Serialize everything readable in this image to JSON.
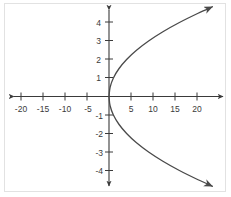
{
  "figure": {
    "title": "",
    "background_color": "#ffffff",
    "border_color": "#e2e2e2",
    "axis_color": "#3a3a3a",
    "curve_color": "#4a4a4a"
  },
  "chart_data": {
    "type": "line",
    "title": "",
    "xlabel": "",
    "ylabel": "",
    "xlim": [
      -25,
      25
    ],
    "ylim": [
      -5,
      5
    ],
    "grid": false,
    "legend": null,
    "x_ticks": [
      -20,
      -15,
      -10,
      -5,
      5,
      10,
      15,
      20
    ],
    "x_tick_labels": [
      "-20",
      "-15",
      "-10",
      "-5",
      "5",
      "10",
      "15",
      "20"
    ],
    "y_ticks": [
      4,
      3,
      2,
      1,
      -1,
      -2,
      -3,
      -4
    ],
    "y_tick_labels": [
      "4",
      "3",
      "2",
      "1",
      "-1",
      "-2",
      "-3",
      "-4"
    ],
    "x_tick_step": 5,
    "y_tick_step": 1,
    "series": [
      {
        "name": "upper-branch",
        "equation": "y = sqrt(x)",
        "points": [
          {
            "x": 0,
            "y": 0
          },
          {
            "x": 0.25,
            "y": 0.5
          },
          {
            "x": 1,
            "y": 1
          },
          {
            "x": 2.25,
            "y": 1.5
          },
          {
            "x": 4,
            "y": 2
          },
          {
            "x": 6.25,
            "y": 2.5
          },
          {
            "x": 9,
            "y": 3
          },
          {
            "x": 12.25,
            "y": 3.5
          },
          {
            "x": 16,
            "y": 4
          },
          {
            "x": 20.25,
            "y": 4.5
          },
          {
            "x": 23.5,
            "y": 4.85
          }
        ],
        "arrow_end": true
      },
      {
        "name": "lower-branch",
        "equation": "y = -sqrt(x)",
        "points": [
          {
            "x": 0,
            "y": 0
          },
          {
            "x": 0.25,
            "y": -0.5
          },
          {
            "x": 1,
            "y": -1
          },
          {
            "x": 2.25,
            "y": -1.5
          },
          {
            "x": 4,
            "y": -2
          },
          {
            "x": 6.25,
            "y": -2.5
          },
          {
            "x": 9,
            "y": -3
          },
          {
            "x": 12.25,
            "y": -3.5
          },
          {
            "x": 16,
            "y": -4
          },
          {
            "x": 20.25,
            "y": -4.5
          },
          {
            "x": 23.5,
            "y": -4.85
          }
        ],
        "arrow_end": true
      }
    ]
  },
  "axes": {
    "x_axis_label": "x-axis",
    "y_axis_label": "y-axis",
    "x_arrow_left": true,
    "x_arrow_right": true,
    "y_arrow_up": true,
    "y_arrow_down": true
  }
}
